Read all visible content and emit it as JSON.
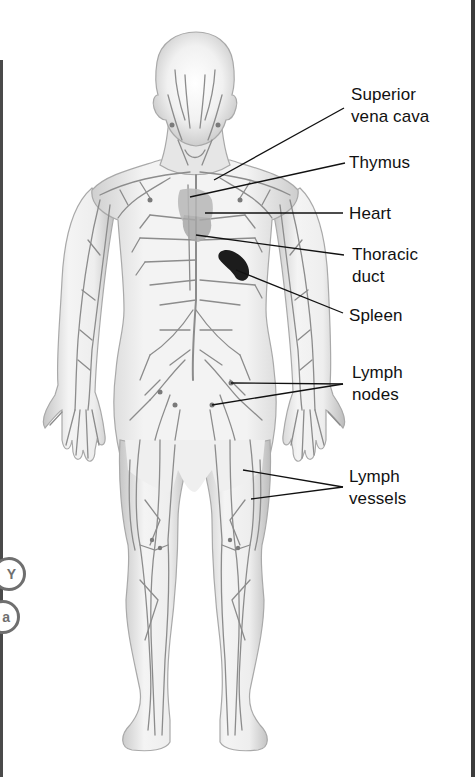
{
  "figure": {
    "labels": [
      {
        "id": "superior-vena-cava",
        "text": "Superior\nvena cava",
        "x": 351,
        "y": 84,
        "leaders": [
          [
            344,
            108,
            214,
            180
          ]
        ]
      },
      {
        "id": "thymus",
        "text": "Thymus",
        "x": 349,
        "y": 152,
        "leaders": [
          [
            345,
            163,
            190,
            197
          ]
        ]
      },
      {
        "id": "heart",
        "text": "Heart",
        "x": 349,
        "y": 203,
        "leaders": [
          [
            343,
            213,
            205,
            213
          ]
        ]
      },
      {
        "id": "thoracic-duct",
        "text": "Thoracic\nduct",
        "x": 352,
        "y": 244,
        "leaders": [
          [
            344,
            255,
            196,
            235
          ]
        ]
      },
      {
        "id": "spleen",
        "text": "Spleen",
        "x": 349,
        "y": 305,
        "leaders": [
          [
            343,
            313,
            236,
            270
          ]
        ]
      },
      {
        "id": "lymph-nodes",
        "text": "Lymph\nnodes",
        "x": 352,
        "y": 362,
        "leaders": [
          [
            343,
            384,
            231,
            383
          ],
          [
            343,
            384,
            212,
            405
          ]
        ]
      },
      {
        "id": "lymph-vessels",
        "text": "Lymph\nvessels",
        "x": 349,
        "y": 466,
        "leaders": [
          [
            343,
            487,
            243,
            470
          ],
          [
            343,
            487,
            251,
            499
          ]
        ]
      }
    ],
    "side_tabs": [
      {
        "id": "tab-y",
        "glyph": "Y",
        "x": -8,
        "y": 557
      },
      {
        "id": "tab-a",
        "glyph": "a",
        "x": -14,
        "y": 600
      }
    ],
    "colors": {
      "body_fill": "#e9e9e9",
      "body_edge": "#a9a9a9",
      "vessel": "#8c8c8c",
      "organ": "#b8b8b8",
      "spleen": "#1c1c1c",
      "leader": "#111111",
      "frame": "#444444"
    }
  }
}
